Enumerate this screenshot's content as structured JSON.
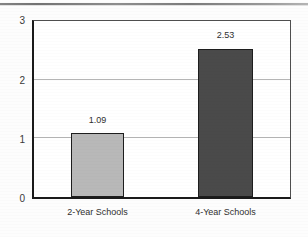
{
  "chart_data": {
    "type": "bar",
    "title": "",
    "subtitle": "",
    "xlabel": "",
    "ylabel": "",
    "categories": [
      "2-Year Schools",
      "4-Year Schools"
    ],
    "values": [
      1.09,
      2.53
    ],
    "value_labels": [
      "1.09",
      "2.53"
    ],
    "ylim": [
      0,
      3
    ],
    "yticks": [
      0,
      1,
      2,
      3
    ],
    "ytick_labels": [
      "0",
      "1",
      "2",
      "3"
    ],
    "gridlines": [
      "1",
      "2"
    ],
    "grid": true,
    "legend": "none",
    "bar_colors": [
      "#b8b8b8",
      "#4a4a4a"
    ],
    "bar_border_color": "#1d1d1d",
    "axis_color": "#1a1a1a",
    "grid_color": "#b5b5b5",
    "background": "#ffffff"
  },
  "axis": {
    "y": {
      "tick_3": "3",
      "tick_2": "2",
      "tick_1": "1",
      "tick_0": "0"
    }
  },
  "bars": [
    {
      "category": "2-Year Schools",
      "value_label": "1.09"
    },
    {
      "category": "4-Year Schools",
      "value_label": "2.53"
    }
  ]
}
